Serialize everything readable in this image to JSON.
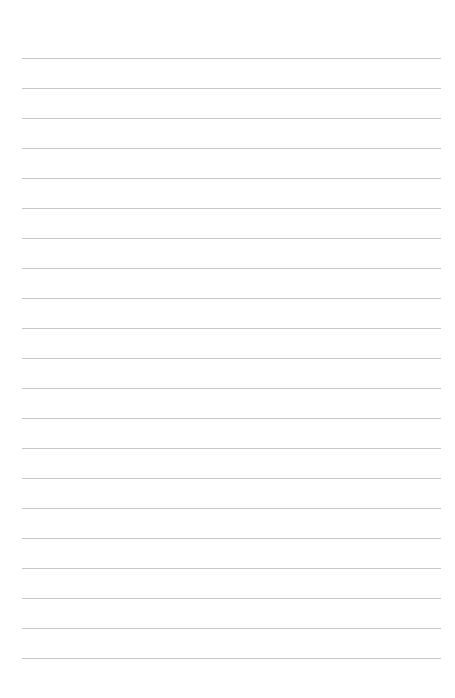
{
  "page": {
    "type": "lined-paper",
    "line_count": 21,
    "first_line_y": 58,
    "line_spacing": 30,
    "line_left": 22,
    "line_right": 441,
    "line_color": "#c8c8c8",
    "background_color": "#ffffff"
  }
}
